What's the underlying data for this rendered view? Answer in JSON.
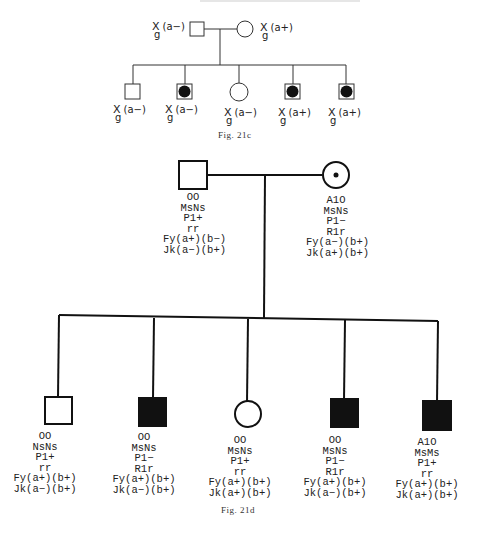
{
  "header": {
    "text_faint": "…"
  },
  "fig21c": {
    "caption": "Fig. 21c",
    "father": {
      "sex": "male",
      "affected": false,
      "label_main": "X",
      "label_sub": "g",
      "label_paren": "(a−)"
    },
    "mother": {
      "sex": "female",
      "affected": false,
      "label_main": "X",
      "label_sub": "g",
      "label_paren": "(a+)"
    },
    "children": [
      {
        "sex": "male",
        "affected": false,
        "label_main": "X",
        "label_sub": "g",
        "label_paren": "(a−)"
      },
      {
        "sex": "male",
        "affected": true,
        "label_main": "X",
        "label_sub": "g",
        "label_paren": "(a−)"
      },
      {
        "sex": "female",
        "affected": false,
        "label_main": "X",
        "label_sub": "g",
        "label_paren": "(a−)"
      },
      {
        "sex": "male",
        "affected": true,
        "label_main": "X",
        "label_sub": "g",
        "label_paren": "(a+)"
      },
      {
        "sex": "male",
        "affected": true,
        "label_main": "X",
        "label_sub": "g",
        "label_paren": "(a+)"
      }
    ]
  },
  "fig21d": {
    "caption": "Fig. 21d",
    "father": {
      "sex": "male",
      "affected": false,
      "lines": [
        "OO",
        "MsNs",
        "P1+",
        "rr",
        "Fy(a+)(b−)",
        "Jk(a−)(b+)"
      ]
    },
    "mother": {
      "sex": "female",
      "carrier_dot": true,
      "lines": [
        "A1O",
        "MsNs",
        "P1−",
        "R1r",
        "Fy(a−)(b+)",
        "Jk(a+)(b+)"
      ]
    },
    "children": [
      {
        "sex": "male",
        "affected": false,
        "lines": [
          "OO",
          "NsNs",
          "P1+",
          "rr",
          "Fy(a+)(b+)",
          "Jk(a−)(b+)"
        ]
      },
      {
        "sex": "male",
        "affected": true,
        "lines": [
          "OO",
          "MsNs",
          "P1−",
          "R1r",
          "Fy(a+)(b+)",
          "Jk(a−)(b+)"
        ]
      },
      {
        "sex": "female",
        "affected": false,
        "lines": [
          "OO",
          "MsNs",
          "P1+",
          "rr",
          "Fy(a+)(b+)",
          "Jk(a+)(b+)"
        ]
      },
      {
        "sex": "male",
        "affected": true,
        "lines": [
          "OO",
          "MsNs",
          "P1−",
          "R1r",
          "Fy(a+)(b+)",
          "Jk(a−)(b+)"
        ]
      },
      {
        "sex": "male",
        "affected": true,
        "lines": [
          "A1O",
          "MsMs",
          "P1+",
          "rr",
          "Fy(a+)(b+)",
          "Jk(a+)(b+)"
        ]
      }
    ]
  }
}
